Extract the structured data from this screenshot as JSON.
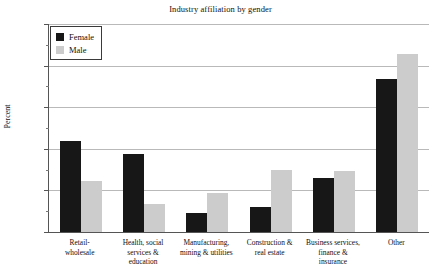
{
  "chart_data": {
    "type": "bar",
    "title": "Industry affiliation by gender",
    "xlabel": "",
    "ylabel": "Percent",
    "ylim": [
      0,
      50
    ],
    "ytick_labels": [
      "0",
      "10",
      "20",
      "30",
      "40",
      "50"
    ],
    "ytick_values": [
      0,
      10,
      20,
      30,
      40,
      50
    ],
    "yminor_values": [
      5,
      15,
      25,
      35,
      45
    ],
    "grid": true,
    "legend_position": "upper left",
    "categories": [
      "Retail-\nwholesale",
      "Health, social\nservices &\neducation",
      "Manufacturing,\nmining & utilities",
      "Construction &\nreal estate",
      "Business services,\nfinance &\ninsurance",
      "Other"
    ],
    "series": [
      {
        "name": "Female",
        "color": "#171717",
        "values": [
          21.8,
          18.7,
          4.6,
          6.0,
          13.0,
          36.9
        ]
      },
      {
        "name": "Male",
        "color": "#cccccc",
        "values": [
          12.3,
          6.7,
          9.4,
          15.0,
          14.6,
          42.7
        ]
      }
    ]
  },
  "legend": {
    "items": [
      {
        "label": "Female"
      },
      {
        "label": "Male"
      }
    ]
  },
  "categories_display": [
    {
      "lines": [
        "Retail-",
        "wholesale"
      ]
    },
    {
      "lines": [
        "Health, social",
        "services &",
        "education"
      ]
    },
    {
      "lines": [
        "Manufacturing,",
        "mining & utilities"
      ]
    },
    {
      "lines": [
        "Construction &",
        "real estate"
      ]
    },
    {
      "lines": [
        "Business services,",
        "finance &",
        "insurance"
      ]
    },
    {
      "lines": [
        "Other"
      ]
    }
  ]
}
